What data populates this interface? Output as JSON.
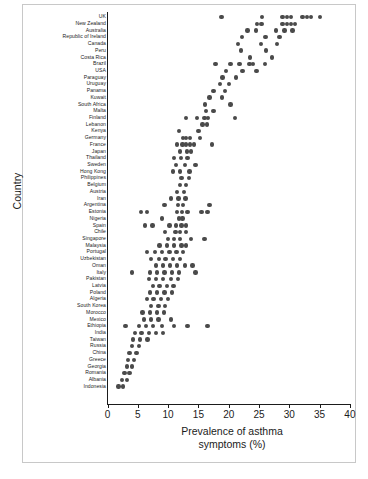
{
  "figure": {
    "width": 368,
    "height": 479,
    "background": "#ffffff",
    "frame_color": "#c8c8c8",
    "dot_color": "#4a4a4a",
    "axis_color": "#1b1b1b"
  },
  "axes": {
    "x_title_line1": "Prevalence of asthma",
    "x_title_line2": "symptoms (%)",
    "y_title": "Country",
    "x_ticks": [
      "0",
      "5",
      "10",
      "15",
      "20",
      "25",
      "30",
      "35",
      "40"
    ],
    "x_tick_values": [
      0,
      5,
      10,
      15,
      20,
      25,
      30,
      35,
      40
    ]
  },
  "chart_data": {
    "type": "scatter",
    "title": "",
    "subtitle": "",
    "xlabel": "Prevalence of asthma symptoms (%)",
    "ylabel": "Country",
    "xlim": [
      0,
      40
    ],
    "xticks": [
      0,
      5,
      10,
      15,
      20,
      25,
      30,
      35,
      40
    ],
    "grid": false,
    "legend": null,
    "orientation": "horizontal-dotplot",
    "note": "Each row is a country; each dot is one centre/survey value of asthma symptom prevalence (%). Countries ordered from highest (UK, top) to lowest (Indonesia, bottom).",
    "categories": [
      "UK",
      "New Zealand",
      "Australia",
      "Republic of Ireland",
      "Canada",
      "Peru",
      "Costa Rica",
      "Brazil",
      "USA",
      "Paraguay",
      "Uruguay",
      "Panama",
      "Kuwait",
      "South Africa",
      "Malta",
      "Finland",
      "Lebanon",
      "Kenya",
      "Germany",
      "France",
      "Japan",
      "Thailand",
      "Sweden",
      "Hong Kong",
      "Philippines",
      "Belgium",
      "Austria",
      "Iran",
      "Argentina",
      "Estonia",
      "Nigeria",
      "Spain",
      "Chile",
      "Singapore",
      "Malaysia",
      "Portugal",
      "Uzbekistan",
      "Oman",
      "Italy",
      "Pakistan",
      "Latvia",
      "Poland",
      "Algeria",
      "South Korea",
      "Morocco",
      "Mexico",
      "Ethiopia",
      "India",
      "Taiwan",
      "Russia",
      "China",
      "Greece",
      "Georgia",
      "Romania",
      "Albania",
      "Indonesia"
    ],
    "series": [
      {
        "name": "Prevalence of asthma symptoms (%)",
        "points_by_country": [
          {
            "country": "UK",
            "values": [
              18.8,
              25.5,
              28.9,
              29.6,
              30.3,
              32.2,
              32.9,
              33.6,
              35.1
            ]
          },
          {
            "country": "New Zealand",
            "values": [
              24.7,
              25.4,
              28.9,
              29.6,
              30.3,
              30.9
            ]
          },
          {
            "country": "Australia",
            "values": [
              23.1,
              24.5,
              27.8,
              29.2,
              30.5
            ]
          },
          {
            "country": "Republic of Ireland",
            "values": [
              22.2,
              26.1,
              28.4
            ]
          },
          {
            "country": "Canada",
            "values": [
              21.5,
              25.3,
              28.0
            ]
          },
          {
            "country": "Peru",
            "values": [
              22.0,
              26.2
            ]
          },
          {
            "country": "Costa Rica",
            "values": [
              23.5,
              27.1
            ]
          },
          {
            "country": "Brazil",
            "values": [
              17.8,
              20.3,
              21.8,
              23.4,
              24.0,
              26.0
            ]
          },
          {
            "country": "USA",
            "values": [
              19.6,
              22.3,
              24.6
            ]
          },
          {
            "country": "Paraguay",
            "values": [
              19.0,
              21.2
            ]
          },
          {
            "country": "Uruguay",
            "values": [
              18.6,
              20.0
            ]
          },
          {
            "country": "Panama",
            "values": [
              17.5,
              19.4
            ]
          },
          {
            "country": "Kuwait",
            "values": [
              16.8,
              18.9
            ]
          },
          {
            "country": "South Africa",
            "values": [
              16.1,
              20.3
            ]
          },
          {
            "country": "Malta",
            "values": [
              16.3,
              17.5
            ]
          },
          {
            "country": "Finland",
            "values": [
              13.0,
              14.8,
              16.0,
              16.6,
              21.0
            ]
          },
          {
            "country": "Lebanon",
            "values": [
              15.7,
              16.4
            ]
          },
          {
            "country": "Kenya",
            "values": [
              11.8,
              15.0
            ]
          },
          {
            "country": "Germany",
            "values": [
              12.5,
              13.0,
              13.6,
              15.3
            ]
          },
          {
            "country": "France",
            "values": [
              11.5,
              12.4,
              13.0,
              13.6,
              14.3,
              17.2
            ]
          },
          {
            "country": "Japan",
            "values": [
              12.0,
              13.1,
              13.8
            ]
          },
          {
            "country": "Thailand",
            "values": [
              11.0,
              12.1,
              13.2
            ]
          },
          {
            "country": "Sweden",
            "values": [
              11.3,
              12.8,
              14.5
            ]
          },
          {
            "country": "Hong Kong",
            "values": [
              10.8,
              12.0,
              13.5
            ]
          },
          {
            "country": "Philippines",
            "values": [
              12.2,
              13.4
            ]
          },
          {
            "country": "Belgium",
            "values": [
              12.0,
              13.0
            ]
          },
          {
            "country": "Austria",
            "values": [
              11.5,
              12.6
            ]
          },
          {
            "country": "Iran",
            "values": [
              10.5,
              11.7,
              12.9
            ]
          },
          {
            "country": "Argentina",
            "values": [
              9.4,
              11.6,
              12.5,
              16.8
            ]
          },
          {
            "country": "Estonia",
            "values": [
              5.5,
              6.5,
              11.5,
              12.3,
              13.2,
              15.5,
              16.5
            ]
          },
          {
            "country": "Nigeria",
            "values": [
              9.0,
              11.8,
              12.4
            ]
          },
          {
            "country": "Spain",
            "values": [
              6.2,
              7.4,
              10.2,
              11.3,
              12.2,
              13.0
            ]
          },
          {
            "country": "Chile",
            "values": [
              9.5,
              11.2,
              12.0,
              13.0
            ]
          },
          {
            "country": "Singapore",
            "values": [
              10.0,
              11.0,
              12.0,
              13.8,
              16.0
            ]
          },
          {
            "country": "Malaysia",
            "values": [
              8.6,
              9.8,
              11.0,
              12.2,
              13.0
            ]
          },
          {
            "country": "Portugal",
            "values": [
              6.5,
              7.8,
              9.0,
              10.2,
              11.4,
              12.5
            ]
          },
          {
            "country": "Uzbekistan",
            "values": [
              7.2,
              8.5,
              9.6,
              10.8,
              12.0
            ]
          },
          {
            "country": "Oman",
            "values": [
              8.0,
              9.2,
              10.3,
              11.5,
              12.8,
              14.0
            ]
          },
          {
            "country": "Italy",
            "values": [
              4.0,
              7.0,
              8.2,
              9.4,
              10.6,
              11.8,
              14.5
            ]
          },
          {
            "country": "Pakistan",
            "values": [
              6.8,
              8.0,
              9.2,
              10.5,
              11.6
            ]
          },
          {
            "country": "Latvia",
            "values": [
              7.5,
              8.6,
              9.8,
              10.9
            ]
          },
          {
            "country": "Poland",
            "values": [
              7.0,
              8.2,
              9.4,
              10.6
            ]
          },
          {
            "country": "Algeria",
            "values": [
              6.5,
              7.6,
              8.8,
              10.0
            ]
          },
          {
            "country": "South Korea",
            "values": [
              7.2,
              8.4,
              9.5
            ]
          },
          {
            "country": "Morocco",
            "values": [
              5.8,
              7.0,
              8.2,
              9.3
            ]
          },
          {
            "country": "Mexico",
            "values": [
              6.0,
              7.2,
              8.4,
              10.5
            ]
          },
          {
            "country": "Ethiopia",
            "values": [
              3.0,
              5.2,
              6.4,
              7.5,
              9.0,
              11.0,
              13.2,
              16.5
            ]
          },
          {
            "country": "India",
            "values": [
              4.5,
              5.6,
              6.8,
              8.0,
              9.2
            ]
          },
          {
            "country": "Taiwan",
            "values": [
              4.2,
              5.4,
              6.6
            ]
          },
          {
            "country": "Russia",
            "values": [
              4.0,
              5.2
            ]
          },
          {
            "country": "China",
            "values": [
              3.6,
              4.8
            ]
          },
          {
            "country": "Greece",
            "values": [
              3.4,
              4.4
            ]
          },
          {
            "country": "Georgia",
            "values": [
              3.2,
              4.0
            ]
          },
          {
            "country": "Romania",
            "values": [
              2.8,
              3.6
            ]
          },
          {
            "country": "Albania",
            "values": [
              2.4,
              3.2
            ]
          },
          {
            "country": "Indonesia",
            "values": [
              1.8,
              2.6
            ]
          }
        ]
      }
    ]
  }
}
